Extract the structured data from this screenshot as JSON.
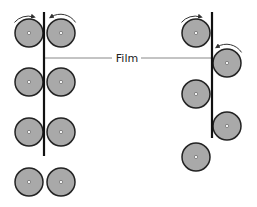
{
  "diagram": {
    "label": "Film",
    "colors": {
      "roller_fill": "#a9a9a9",
      "roller_stroke": "#222222",
      "film": "#111111",
      "leader": "#888888",
      "arrow": "#333333"
    },
    "left_assembly": {
      "film_line": {
        "x": 44,
        "y1": 12,
        "y2": 156
      },
      "rollers": [
        {
          "cx": 29,
          "cy": 33,
          "r": 14,
          "arrow": "clockwise-top"
        },
        {
          "cx": 61,
          "cy": 33,
          "r": 14,
          "arrow": "counterclockwise-top"
        },
        {
          "cx": 29,
          "cy": 82,
          "r": 14
        },
        {
          "cx": 61,
          "cy": 82,
          "r": 14
        },
        {
          "cx": 29,
          "cy": 132,
          "r": 14
        },
        {
          "cx": 61,
          "cy": 132,
          "r": 14
        },
        {
          "cx": 29,
          "cy": 182,
          "r": 14
        },
        {
          "cx": 61,
          "cy": 182,
          "r": 14
        }
      ]
    },
    "right_assembly": {
      "film_line": {
        "x": 212,
        "y1": 12,
        "y2": 138
      },
      "rollers": [
        {
          "cx": 196,
          "cy": 33,
          "r": 14,
          "arrow": "clockwise-top"
        },
        {
          "cx": 227,
          "cy": 63,
          "r": 14,
          "arrow": "counterclockwise-top"
        },
        {
          "cx": 196,
          "cy": 94,
          "r": 14
        },
        {
          "cx": 227,
          "cy": 126,
          "r": 14
        },
        {
          "cx": 196,
          "cy": 157,
          "r": 14
        }
      ]
    },
    "leader_lines": [
      {
        "x1": 44,
        "y1": 58,
        "x2": 112,
        "y2": 58
      },
      {
        "x1": 141,
        "y1": 58,
        "x2": 212,
        "y2": 58
      }
    ],
    "label_pos": {
      "x": 127,
      "y": 62
    }
  }
}
